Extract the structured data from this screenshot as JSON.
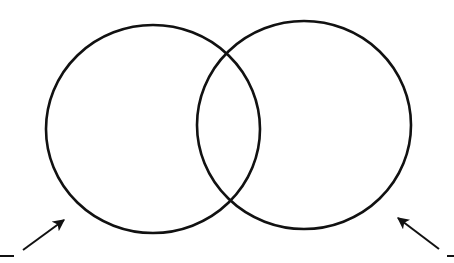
{
  "diagram": {
    "type": "venn",
    "background": "#ffffff",
    "stroke_color": "#111111",
    "circles": [
      {
        "name": "left-set",
        "cx": 153,
        "cy": 129,
        "rx": 107,
        "ry": 104
      },
      {
        "name": "right-set",
        "cx": 304,
        "cy": 125,
        "rx": 107,
        "ry": 104
      }
    ],
    "arrows": [
      {
        "name": "left-arrow",
        "x1": 23,
        "y1": 250,
        "x2": 64,
        "y2": 220
      },
      {
        "name": "right-arrow",
        "x1": 439,
        "y1": 249,
        "x2": 398,
        "y2": 218
      }
    ],
    "label_blanks": [
      {
        "name": "left-label-blank",
        "x1": 0,
        "y1": 256,
        "x2": 14,
        "y2": 256
      },
      {
        "name": "right-label-blank",
        "x1": 447,
        "y1": 256,
        "x2": 454,
        "y2": 256
      }
    ]
  }
}
